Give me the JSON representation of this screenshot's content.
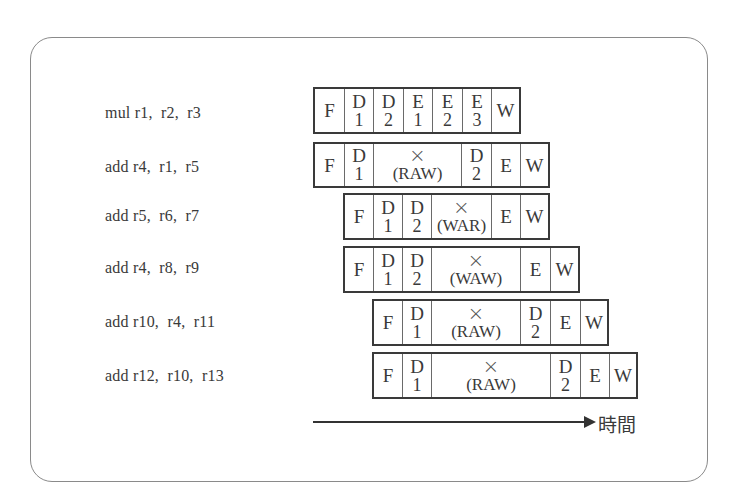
{
  "instructions": [
    {
      "text": "mul r1,  r2,  r3",
      "stages": [
        {
          "top": "F",
          "bottom": "",
          "units": 1
        },
        {
          "top": "D",
          "bottom": "1",
          "units": 1
        },
        {
          "top": "D",
          "bottom": "2",
          "units": 1
        },
        {
          "top": "E",
          "bottom": "1",
          "units": 1
        },
        {
          "top": "E",
          "bottom": "2",
          "units": 1
        },
        {
          "top": "E",
          "bottom": "3",
          "units": 1
        },
        {
          "top": "W",
          "bottom": "",
          "units": 1
        }
      ],
      "start_unit": 0
    },
    {
      "text": "add r4,  r1,  r5",
      "stages": [
        {
          "top": "F",
          "bottom": "",
          "units": 1
        },
        {
          "top": "D",
          "bottom": "1",
          "units": 1
        },
        {
          "top": "×",
          "bottom": "(RAW)",
          "units": 3,
          "stall": true
        },
        {
          "top": "D",
          "bottom": "2",
          "units": 1
        },
        {
          "top": "E",
          "bottom": "",
          "units": 1
        },
        {
          "top": "W",
          "bottom": "",
          "units": 1
        }
      ],
      "start_unit": 0
    },
    {
      "text": "add r5,  r6,  r7",
      "stages": [
        {
          "top": "F",
          "bottom": "",
          "units": 1
        },
        {
          "top": "D",
          "bottom": "1",
          "units": 1
        },
        {
          "top": "D",
          "bottom": "2",
          "units": 1
        },
        {
          "top": "×",
          "bottom": "(WAR)",
          "units": 2,
          "stall": true
        },
        {
          "top": "E",
          "bottom": "",
          "units": 1
        },
        {
          "top": "W",
          "bottom": "",
          "units": 1
        }
      ],
      "start_unit": 1
    },
    {
      "text": "add r4,  r8,  r9",
      "stages": [
        {
          "top": "F",
          "bottom": "",
          "units": 1
        },
        {
          "top": "D",
          "bottom": "1",
          "units": 1
        },
        {
          "top": "D",
          "bottom": "2",
          "units": 1
        },
        {
          "top": "×",
          "bottom": "(WAW)",
          "units": 3,
          "stall": true
        },
        {
          "top": "E",
          "bottom": "",
          "units": 1
        },
        {
          "top": "W",
          "bottom": "",
          "units": 1
        }
      ],
      "start_unit": 1
    },
    {
      "text": "add r10,  r4,  r11",
      "stages": [
        {
          "top": "F",
          "bottom": "",
          "units": 1
        },
        {
          "top": "D",
          "bottom": "1",
          "units": 1
        },
        {
          "top": "×",
          "bottom": "(RAW)",
          "units": 3,
          "stall": true
        },
        {
          "top": "D",
          "bottom": "2",
          "units": 1
        },
        {
          "top": "E",
          "bottom": "",
          "units": 1
        },
        {
          "top": "W",
          "bottom": "",
          "units": 1
        }
      ],
      "start_unit": 2
    },
    {
      "text": "add r12,  r10,  r13",
      "stages": [
        {
          "top": "F",
          "bottom": "",
          "units": 1
        },
        {
          "top": "D",
          "bottom": "1",
          "units": 1
        },
        {
          "top": "×",
          "bottom": "(RAW)",
          "units": 4,
          "stall": true
        },
        {
          "top": "D",
          "bottom": "2",
          "units": 1
        },
        {
          "top": "E",
          "bottom": "",
          "units": 1
        },
        {
          "top": "W",
          "bottom": "",
          "units": 1
        }
      ],
      "start_unit": 2
    }
  ],
  "time_axis": {
    "label": "時間"
  }
}
